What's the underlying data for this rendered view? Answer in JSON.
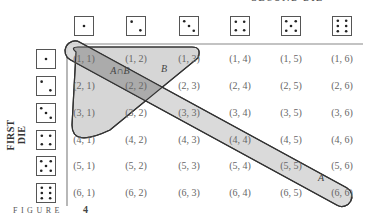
{
  "figure": {
    "label": "FIGURE",
    "number": "4",
    "top_axis_label": "SECOND DIE",
    "side_axis_label": "FIRST DIE"
  },
  "dice": {
    "columns": [
      1,
      2,
      3,
      4,
      5,
      6
    ],
    "rows": [
      1,
      2,
      3,
      4,
      5,
      6
    ]
  },
  "grid": {
    "rows": [
      [
        "(1, 1)",
        "(1, 2)",
        "(1, 3)",
        "(1, 4)",
        "(1, 5)",
        "(1, 6)"
      ],
      [
        "(2, 1)",
        "(2, 2)",
        "(2, 3)",
        "(2, 4)",
        "(2, 5)",
        "(2, 6)"
      ],
      [
        "(3, 1)",
        "(3, 2)",
        "(3, 3)",
        "(3, 4)",
        "(3, 5)",
        "(3, 6)"
      ],
      [
        "(4, 1)",
        "(4, 2)",
        "(4, 3)",
        "(4, 4)",
        "(4, 5)",
        "(4, 6)"
      ],
      [
        "(5, 1)",
        "(5, 2)",
        "(5, 3)",
        "(5, 4)",
        "(5, 5)",
        "(5, 6)"
      ],
      [
        "(6, 1)",
        "(6, 2)",
        "(6, 3)",
        "(6, 4)",
        "(6, 5)",
        "(6, 6)"
      ]
    ]
  },
  "sets": {
    "A": {
      "label": "A",
      "members": [
        "(1, 1)",
        "(2, 2)",
        "(3, 3)",
        "(4, 4)",
        "(5, 5)",
        "(6, 6)"
      ]
    },
    "B": {
      "label": "B",
      "members": [
        "(1, 1)",
        "(1, 2)",
        "(1, 3)",
        "(2, 1)",
        "(2, 2)",
        "(3, 1)"
      ]
    },
    "intersection": {
      "label": "A∩B",
      "members": [
        "(1, 1)",
        "(2, 2)"
      ]
    }
  },
  "colors": {
    "region_fill": "#d4d4d4",
    "overlap_fill": "#a9a9a9",
    "outline": "#3a3a3a",
    "frame": "#888888"
  }
}
